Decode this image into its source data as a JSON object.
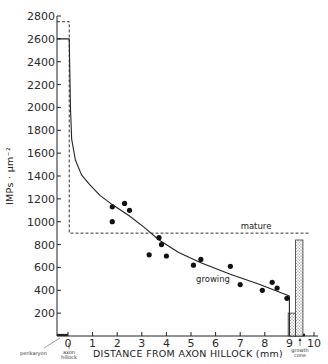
{
  "chart_data": {
    "type": "scatter",
    "title": "",
    "xlabel": "DISTANCE FROM AXON HILLOCK (mm)",
    "ylabel": "IMPs · µm⁻²",
    "xlim": [
      -0.45,
      10
    ],
    "ylim": [
      0,
      2800
    ],
    "x_ticks": [
      "0",
      "1",
      "2",
      "3",
      "4",
      "5",
      "6",
      "7",
      "8",
      "9",
      "10"
    ],
    "y_ticks": [
      "200",
      "400",
      "600",
      "800",
      "1000",
      "1200",
      "1400",
      "1600",
      "1800",
      "2000",
      "2200",
      "2400",
      "2600",
      "2800"
    ],
    "grid": false,
    "annotations": [
      "perikaryon",
      "axon hillock",
      "growth cone",
      "mature",
      "growing"
    ],
    "series": [
      {
        "name": "growing (measured)",
        "type": "scatter",
        "x": [
          1.8,
          1.8,
          2.3,
          2.5,
          3.3,
          3.7,
          3.8,
          4.0,
          5.1,
          5.4,
          6.6,
          7.0,
          7.9,
          8.3,
          8.5,
          8.9
        ],
        "y": [
          1130,
          1000,
          1160,
          1100,
          710,
          860,
          800,
          700,
          620,
          670,
          610,
          450,
          400,
          470,
          420,
          330
        ]
      },
      {
        "name": "growing (fitted curve)",
        "type": "line",
        "style": "solid",
        "x": [
          -0.45,
          0.05,
          0.05,
          0.1,
          0.15,
          0.3,
          0.55,
          0.9,
          1.3,
          1.8,
          2.5,
          3.1,
          3.7,
          4.5,
          5.4,
          6.6,
          7.8,
          9.0,
          9.0
        ],
        "y": [
          2600,
          2600,
          2600,
          2000,
          1720,
          1540,
          1410,
          1320,
          1230,
          1150,
          1050,
          950,
          840,
          730,
          640,
          540,
          450,
          350,
          0
        ]
      },
      {
        "name": "mature",
        "type": "line",
        "style": "dashed",
        "x": [
          -0.45,
          0.05,
          0.05,
          9.8
        ],
        "y": [
          2750,
          2750,
          900,
          900
        ]
      },
      {
        "name": "growth cone (growing)",
        "type": "bar",
        "pattern": "stippled",
        "x": [
          9.1
        ],
        "width": 0.3,
        "y": [
          200
        ]
      },
      {
        "name": "growth cone (mature)",
        "type": "bar",
        "pattern": "stippled",
        "x": [
          9.4
        ],
        "width": 0.3,
        "y": [
          840
        ]
      }
    ]
  },
  "labels": {
    "x_axis_title": "DISTANCE FROM AXON HILLOCK (mm)",
    "y_axis_title": "IMPs · µm⁻²",
    "perikaryon": "perikaryon",
    "axon_hillock_1": "axon",
    "axon_hillock_2": "hillock",
    "growth_cone_1": "growth",
    "growth_cone_2": "cone",
    "mature": "mature",
    "growing": "growing",
    "x_ticks": [
      "0",
      "1",
      "2",
      "3",
      "4",
      "5",
      "6",
      "7",
      "8",
      "9",
      "10"
    ],
    "y_ticks": [
      "200",
      "400",
      "600",
      "800",
      "1000",
      "1200",
      "1400",
      "1600",
      "1800",
      "2000",
      "2200",
      "2400",
      "2600",
      "2800"
    ]
  },
  "colors": {
    "ink": "#222222",
    "background": "#ffffff",
    "bar_fill": "#d8d8d8"
  }
}
